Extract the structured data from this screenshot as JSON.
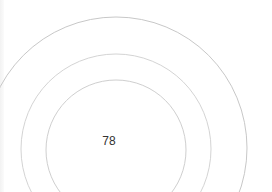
{
  "gauge": {
    "value": "78",
    "ring_color": "#cfcfcf",
    "outer_ring_color": "#c8c8c8",
    "text_color": "#333333",
    "background": "#ffffff",
    "rings": [
      {
        "name": "outer",
        "cx": 116,
        "cy": 148,
        "r": 131
      },
      {
        "name": "middle",
        "cx": 116,
        "cy": 149,
        "r": 95
      },
      {
        "name": "inner",
        "cx": 116,
        "cy": 150,
        "r": 70
      }
    ]
  }
}
